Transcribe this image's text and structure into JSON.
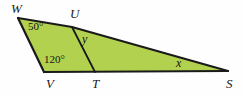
{
  "figure": {
    "width": 242,
    "height": 96,
    "background_color": "#fefefe",
    "fill_color": "#b2d24f",
    "stroke_color": "#1a1a1a"
  },
  "vertices": [
    {
      "name": "W",
      "label": "W",
      "x": 18,
      "y": 18
    },
    {
      "name": "U",
      "label": "U",
      "x": 72,
      "y": 27
    },
    {
      "name": "S",
      "label": "S",
      "x": 228,
      "y": 71
    },
    {
      "name": "T",
      "label": "T",
      "x": 95,
      "y": 72
    },
    {
      "name": "V",
      "label": "V",
      "x": 44,
      "y": 72
    }
  ],
  "angles": [
    {
      "name": "angle-W",
      "label": "50°",
      "value": 50,
      "at_vertex": "W"
    },
    {
      "name": "angle-V",
      "label": "120°",
      "value": 120,
      "at_vertex": "V"
    },
    {
      "name": "angle-y",
      "label": "y",
      "value": null,
      "at_vertex": "U"
    },
    {
      "name": "angle-x",
      "label": "x",
      "value": null,
      "at_vertex": "S"
    }
  ],
  "segments": [
    {
      "name": "segment-WU",
      "from": "W",
      "to": "U"
    },
    {
      "name": "segment-US",
      "from": "U",
      "to": "S"
    },
    {
      "name": "segment-WV",
      "from": "W",
      "to": "V"
    },
    {
      "name": "segment-VT",
      "from": "V",
      "to": "T"
    },
    {
      "name": "segment-TS",
      "from": "T",
      "to": "S"
    },
    {
      "name": "segment-UT",
      "from": "U",
      "to": "T"
    }
  ]
}
